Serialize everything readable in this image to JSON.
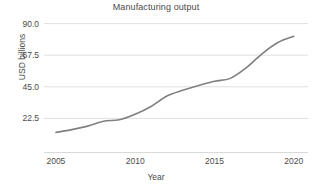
{
  "chart_data": {
    "type": "line",
    "title": "Manufacturing output",
    "xlabel": "Year",
    "ylabel": "USD billions",
    "x": [
      2005,
      2006,
      2007,
      2008,
      2009,
      2010,
      2011,
      2012,
      2013,
      2014,
      2015,
      2016,
      2017,
      2018,
      2019,
      2020
    ],
    "values": [
      12.5,
      14.5,
      17.0,
      20.5,
      21.5,
      25.5,
      31.0,
      38.5,
      42.5,
      46.0,
      49.0,
      51.0,
      58.5,
      68.5,
      76.5,
      81.0
    ],
    "series": [
      {
        "name": "Manufacturing output",
        "values": [
          12.5,
          14.5,
          17.0,
          20.5,
          21.5,
          25.5,
          31.0,
          38.5,
          42.5,
          46.0,
          49.0,
          51.0,
          58.5,
          68.5,
          76.5,
          81.0
        ]
      }
    ],
    "xlim": [
      2004.25,
      2020.9
    ],
    "ylim": [
      0.0,
      94.0
    ],
    "xticks": [
      2005,
      2010,
      2015,
      2020
    ],
    "xtick_labels": [
      "2005",
      "2010",
      "2015",
      "2020"
    ],
    "yticks": [
      22.5,
      45.0,
      67.5,
      90.0
    ],
    "ytick_labels": [
      "22.5",
      "45.0",
      "67.5",
      "90.0"
    ],
    "grid": "horizontal",
    "legend": "none",
    "line_color": "#808080",
    "grid_color": "#e0e0e0",
    "text_color": "#4a4a4a",
    "background_color": "#ffffff",
    "markers": false,
    "line_width": 1.6
  }
}
